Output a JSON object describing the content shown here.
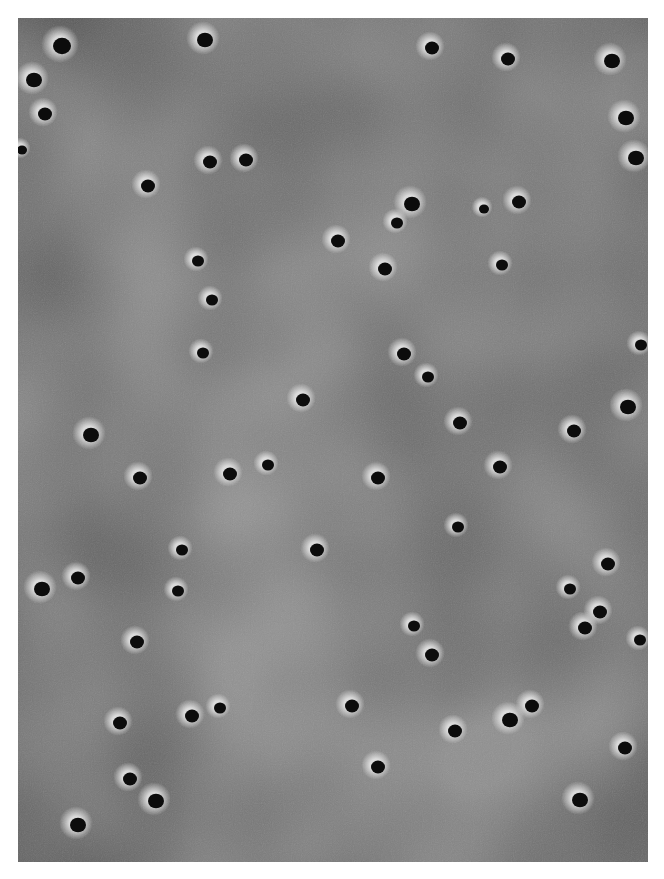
{
  "image": {
    "kind": "grayscale micrograph of porous membrane surface",
    "background_color": "#929292",
    "pore_color": "#0c0c0c",
    "halo_color": "#d8d8d8",
    "frame": {
      "x": 18,
      "y": 18,
      "width": 630,
      "height": 844
    }
  },
  "pores": [
    [
      62,
      46,
      9
    ],
    [
      205,
      40,
      8
    ],
    [
      432,
      48,
      7
    ],
    [
      508,
      59,
      7
    ],
    [
      612,
      61,
      8
    ],
    [
      34,
      80,
      8
    ],
    [
      45,
      114,
      7
    ],
    [
      626,
      118,
      8
    ],
    [
      22,
      150,
      5
    ],
    [
      636,
      158,
      8
    ],
    [
      210,
      162,
      7
    ],
    [
      246,
      160,
      7
    ],
    [
      148,
      186,
      7
    ],
    [
      412,
      204,
      8
    ],
    [
      519,
      202,
      7
    ],
    [
      484,
      209,
      5
    ],
    [
      397,
      223,
      6
    ],
    [
      338,
      241,
      7
    ],
    [
      198,
      261,
      6
    ],
    [
      385,
      269,
      7
    ],
    [
      502,
      265,
      6
    ],
    [
      212,
      300,
      6
    ],
    [
      203,
      353,
      6
    ],
    [
      404,
      354,
      7
    ],
    [
      641,
      345,
      6
    ],
    [
      428,
      377,
      6
    ],
    [
      303,
      400,
      7
    ],
    [
      628,
      407,
      8
    ],
    [
      91,
      435,
      8
    ],
    [
      460,
      423,
      7
    ],
    [
      574,
      431,
      7
    ],
    [
      140,
      478,
      7
    ],
    [
      230,
      474,
      7
    ],
    [
      268,
      465,
      6
    ],
    [
      378,
      478,
      7
    ],
    [
      500,
      467,
      7
    ],
    [
      458,
      527,
      6
    ],
    [
      182,
      550,
      6
    ],
    [
      317,
      550,
      7
    ],
    [
      42,
      589,
      8
    ],
    [
      78,
      578,
      7
    ],
    [
      178,
      591,
      6
    ],
    [
      608,
      564,
      7
    ],
    [
      570,
      589,
      6
    ],
    [
      600,
      612,
      7
    ],
    [
      585,
      628,
      7
    ],
    [
      414,
      626,
      6
    ],
    [
      432,
      655,
      7
    ],
    [
      640,
      640,
      6
    ],
    [
      137,
      642,
      7
    ],
    [
      120,
      723,
      7
    ],
    [
      192,
      716,
      7
    ],
    [
      220,
      708,
      6
    ],
    [
      352,
      706,
      7
    ],
    [
      510,
      720,
      8
    ],
    [
      532,
      706,
      7
    ],
    [
      455,
      731,
      7
    ],
    [
      625,
      748,
      7
    ],
    [
      130,
      779,
      7
    ],
    [
      156,
      801,
      8
    ],
    [
      378,
      767,
      7
    ],
    [
      580,
      800,
      8
    ],
    [
      78,
      825,
      8
    ]
  ]
}
